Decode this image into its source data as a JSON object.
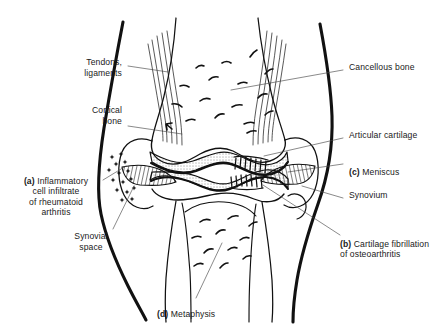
{
  "figure": {
    "ink_color": "#111111",
    "background": "#ffffff"
  },
  "labels": [
    {
      "id": "tendons",
      "text": "Tendons,\nligaments",
      "align": "right",
      "x": 58,
      "y": 60,
      "width": 68
    },
    {
      "id": "cortical",
      "text": "Cortical\nbone",
      "align": "right",
      "x": 58,
      "y": 108,
      "width": 68
    },
    {
      "id": "inflam",
      "text": "(a) Inflammatory\ncell infiltrate\nof rheumatoid\narthritis",
      "align": "center",
      "x": 6,
      "y": 168,
      "width": 104
    },
    {
      "id": "synovial",
      "text": "Synovial\nspace",
      "align": "center",
      "x": 62,
      "y": 232,
      "width": 60
    },
    {
      "id": "cancellous",
      "text": "Cancellous bone",
      "align": "left",
      "x": 345,
      "y": 65,
      "width": 100
    },
    {
      "id": "articular",
      "text": "Articular cartilage",
      "align": "left",
      "x": 345,
      "y": 133,
      "width": 100
    },
    {
      "id": "meniscus",
      "text": "(c) Meniscus",
      "align": "left",
      "x": 345,
      "y": 159,
      "width": 100
    },
    {
      "id": "synovium",
      "text": "Synovium",
      "align": "left",
      "x": 345,
      "y": 194,
      "width": 100
    },
    {
      "id": "fibrill",
      "text": "(b) Cartilage fibrillation\nof osteoarthritis",
      "align": "left",
      "x": 338,
      "y": 231,
      "width": 110
    },
    {
      "id": "metaphysis",
      "text": "(d) Metaphysis",
      "align": "left",
      "x": 157,
      "y": 300,
      "width": 90
    }
  ],
  "label_bold_prefix": {
    "inflam": "(a)",
    "meniscus": "(c)",
    "fibrill": "(b)",
    "metaphysis": "(d)"
  },
  "structures": [
    "skin-outline-left",
    "skin-outline-right",
    "femur-shaft",
    "femoral-condyles",
    "tibia-shaft",
    "tibial-plateau",
    "patellar-tendon-left",
    "patellar-tendon-right",
    "articular-cartilage-upper",
    "articular-cartilage-lower",
    "meniscus-left",
    "meniscus-right",
    "synovium-capsule-left",
    "synovium-capsule-right",
    "inflammatory-cells",
    "cartilage-fibrillation-upper",
    "cartilage-fibrillation-lower",
    "cancellous-trabeculae-femur",
    "cancellous-trabeculae-tibia"
  ]
}
